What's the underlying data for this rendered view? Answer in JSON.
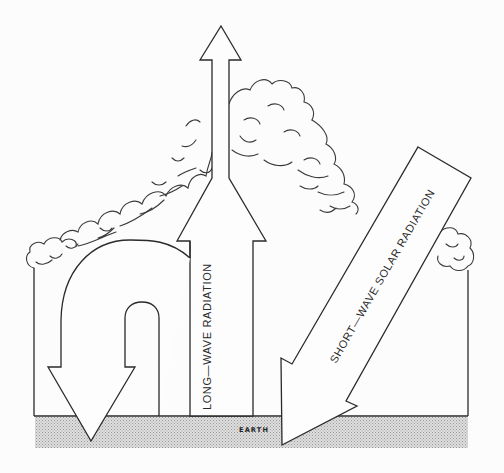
{
  "diagram": {
    "title": "",
    "labels": {
      "long_wave": "LONG—WAVE  RADIATION",
      "short_wave": "SHORT—WAVE  SOLAR  RADIATION",
      "earth": "EARTH"
    },
    "elements": [
      {
        "id": "earth-surface",
        "kind": "ground band",
        "label": "EARTH"
      },
      {
        "id": "atmosphere-enclosure",
        "kind": "box walls"
      },
      {
        "id": "cloud-layer",
        "kind": "clouds",
        "shape": "roof-like triangle"
      },
      {
        "id": "long-wave-up-arrow",
        "kind": "arrow",
        "direction": "up",
        "escapes": true
      },
      {
        "id": "long-wave-back-radiation-arrow",
        "kind": "u-turn arrow",
        "direction": "down to earth"
      },
      {
        "id": "short-wave-solar-arrow",
        "kind": "arrow",
        "direction": "diagonal down-left to earth"
      }
    ],
    "colors": {
      "line": "#2a2a2a",
      "background": "#fcfcfc",
      "earth_fill": "#cfcfcf"
    }
  }
}
